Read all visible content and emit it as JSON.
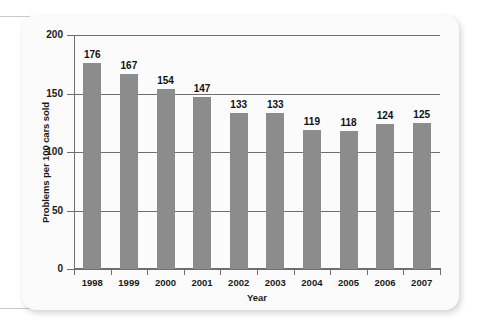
{
  "figure": {
    "background_color": "#fbfbfb",
    "bar_color": "#8c8c8c",
    "axis_color": "#6f6f6f"
  },
  "chart_data": {
    "type": "bar",
    "title": "",
    "xlabel": "Year",
    "ylabel": "Problems per 100 cars sold",
    "categories": [
      "1998",
      "1999",
      "2000",
      "2001",
      "2002",
      "2003",
      "2004",
      "2005",
      "2006",
      "2007"
    ],
    "values": [
      176,
      167,
      154,
      147,
      133,
      133,
      119,
      118,
      124,
      125
    ],
    "data_labels": [
      "176",
      "167",
      "154",
      "147",
      "133",
      "133",
      "119",
      "118",
      "124",
      "125"
    ],
    "ylim": [
      0,
      200
    ],
    "yticks": [
      0,
      50,
      100,
      150,
      200
    ],
    "ytick_labels": [
      "0",
      "50",
      "100",
      "150",
      "200"
    ],
    "grid": true,
    "grid_axis": "y",
    "legend": false,
    "legend_position": "none"
  }
}
